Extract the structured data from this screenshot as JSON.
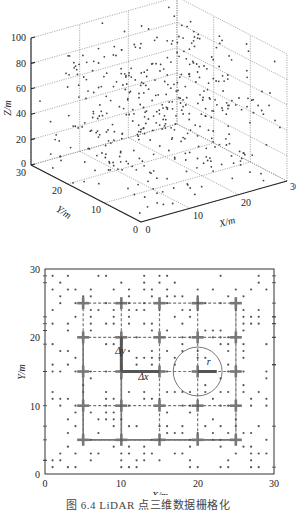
{
  "caption": "图 6.4  LiDAR 点三维数据栅格化",
  "chart_data": [
    {
      "type": "scatter3d",
      "title": "",
      "xlabel": "X/m",
      "ylabel": "Y/m",
      "zlabel": "Z/m",
      "xlim": [
        0,
        30
      ],
      "ylim": [
        0,
        30
      ],
      "zlim": [
        0,
        100
      ],
      "x_ticks": [
        "0",
        "10",
        "20",
        "30"
      ],
      "y_ticks": [
        "0",
        "10",
        "20",
        "30"
      ],
      "z_ticks": [
        "0",
        "20",
        "40",
        "60",
        "80",
        "100"
      ],
      "grid": true,
      "description": "Randomly distributed LiDAR point cloud (~400 points) in a 30m x 30m x 100m volume"
    },
    {
      "type": "scatter",
      "title": "",
      "xlabel": "X/m",
      "ylabel": "Y/m",
      "xlim": [
        0,
        30
      ],
      "ylim": [
        0,
        30
      ],
      "x_ticks": [
        "0",
        "10",
        "20",
        "30"
      ],
      "y_ticks": [
        "0",
        "10",
        "20",
        "30"
      ],
      "grid_lines_x": [
        5,
        10,
        15,
        20,
        25
      ],
      "grid_lines_y": [
        5,
        10,
        15,
        20,
        25
      ],
      "annotations": [
        {
          "text": "Δy",
          "x": 9.2,
          "y": 17.5
        },
        {
          "text": "Δx",
          "x": 12.2,
          "y": 13.8
        },
        {
          "text": "r",
          "x": 21.2,
          "y": 16.0
        }
      ],
      "search_circle": {
        "cx": 20,
        "cy": 15,
        "r": 3.2
      },
      "highlight_cell_edges": [
        {
          "from": [
            10,
            15
          ],
          "to": [
            10,
            20
          ],
          "label": "Δy"
        },
        {
          "from": [
            10,
            15
          ],
          "to": [
            15,
            15
          ],
          "label": "Δx"
        },
        {
          "from": [
            20,
            15
          ],
          "to": [
            22.5,
            15
          ],
          "label": "r"
        }
      ],
      "description": "Top-down projection of points onto X-Y plane with 5m grid rasterization"
    }
  ],
  "labels3d": {
    "xlabel": "X/m",
    "ylabel": "Y/m",
    "zlabel": "Z/m",
    "x_ticks": [
      "0",
      "10",
      "20",
      "30"
    ],
    "y_ticks": [
      "0",
      "10",
      "20",
      "30"
    ],
    "z_ticks": [
      "0",
      "20",
      "40",
      "60",
      "80",
      "100"
    ]
  },
  "labels2d": {
    "xlabel": "X/m",
    "ylabel": "Y/m",
    "x_ticks": [
      "0",
      "10",
      "20",
      "30"
    ],
    "y_ticks": [
      "0",
      "10",
      "20",
      "30"
    ],
    "dy": "Δy",
    "dx": "Δx",
    "r": "r"
  },
  "colors": {
    "axis": "#333333",
    "grid": "#888888",
    "point": "#555555",
    "thick_grid": "#777777"
  }
}
